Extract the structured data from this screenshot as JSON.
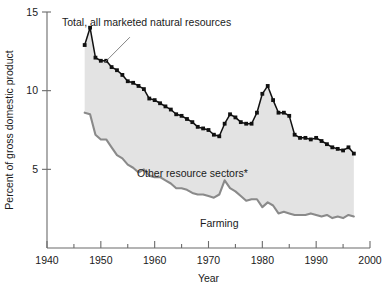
{
  "chart_data": {
    "type": "area",
    "title": "",
    "xlabel": "Year",
    "ylabel": "Percent of gross domestic product",
    "xlim": [
      1940,
      2000
    ],
    "ylim": [
      0,
      15
    ],
    "xticks": [
      1940,
      1950,
      1960,
      1970,
      1980,
      1990,
      2000
    ],
    "xticklabels": [
      "1940",
      "1950",
      "1960",
      "1970",
      "1980",
      "1990",
      "2000"
    ],
    "xminorticks": [
      1945,
      1955,
      1965,
      1975,
      1985,
      1995
    ],
    "yticks": [
      5,
      10,
      15
    ],
    "yticklabels": [
      "5",
      "10",
      "15"
    ],
    "grid": false,
    "legend_position": "inline-annotations",
    "annotations": [
      {
        "name": "total-label",
        "text": "Total, all marketed natural resources",
        "x": 1958.5,
        "y": 14.1
      },
      {
        "name": "other-label",
        "text": "Other resource sectors*",
        "x": 1967.0,
        "y": 4.5
      },
      {
        "name": "farming-label",
        "text": "Farming",
        "x": 1972.0,
        "y": 1.35
      }
    ],
    "x": [
      1947,
      1948,
      1949,
      1950,
      1951,
      1952,
      1953,
      1954,
      1955,
      1956,
      1957,
      1958,
      1959,
      1960,
      1961,
      1962,
      1963,
      1964,
      1965,
      1966,
      1967,
      1968,
      1969,
      1970,
      1971,
      1972,
      1973,
      1974,
      1975,
      1976,
      1977,
      1978,
      1979,
      1980,
      1981,
      1982,
      1983,
      1984,
      1985,
      1986,
      1987,
      1988,
      1989,
      1990,
      1991,
      1992,
      1993,
      1994,
      1995,
      1996,
      1997
    ],
    "series": [
      {
        "name": "Total, all marketed natural resources",
        "color": "#111111",
        "marker": "square",
        "values": [
          12.9,
          14.0,
          12.1,
          11.9,
          11.9,
          11.5,
          11.3,
          11.0,
          10.6,
          10.5,
          10.3,
          10.1,
          9.5,
          9.4,
          9.2,
          9.0,
          8.8,
          8.5,
          8.4,
          8.2,
          8.0,
          7.7,
          7.6,
          7.5,
          7.2,
          7.1,
          7.9,
          8.5,
          8.3,
          8.0,
          7.9,
          7.9,
          8.6,
          9.8,
          10.3,
          9.4,
          8.6,
          8.6,
          8.4,
          7.2,
          7.0,
          7.0,
          6.9,
          7.0,
          6.8,
          6.6,
          6.4,
          6.3,
          6.2,
          6.4,
          6.0
        ]
      },
      {
        "name": "Farming",
        "color": "#8a8a8a",
        "marker": "none",
        "values": [
          8.6,
          8.5,
          7.2,
          6.9,
          6.9,
          6.4,
          5.9,
          5.7,
          5.3,
          5.1,
          4.8,
          5.0,
          4.6,
          4.5,
          4.5,
          4.3,
          4.1,
          3.8,
          3.8,
          3.7,
          3.5,
          3.4,
          3.4,
          3.3,
          3.2,
          3.4,
          4.3,
          3.8,
          3.6,
          3.3,
          3.0,
          3.1,
          3.1,
          2.6,
          2.9,
          2.7,
          2.2,
          2.3,
          2.2,
          2.1,
          2.1,
          2.1,
          2.2,
          2.1,
          2.0,
          2.1,
          1.9,
          2.0,
          1.9,
          2.1,
          2.0
        ]
      }
    ]
  }
}
